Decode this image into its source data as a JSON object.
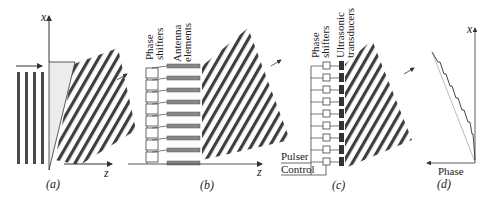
{
  "figure": {
    "colors": {
      "stripe_dark": "#3a3a3a",
      "stripe_light": "#ffffff",
      "prism_fill": "#e9e9e9",
      "line": "#333333",
      "antenna": "#888888",
      "transducer": "#333333"
    },
    "panels": [
      {
        "id": "a",
        "caption": "(a)",
        "axis_x": "x",
        "axis_z": "z",
        "description": "Plane wave passing through a prism, tilted output wavefronts"
      },
      {
        "id": "b",
        "caption": "(b)",
        "label_phase_shifters": "Phase shifters",
        "label_phase_line1": "Phase",
        "label_phase_line2": "shifters",
        "label_elements_line1": "Antenna",
        "label_elements_line2": "elements",
        "axis_z": "z",
        "element_count": 9
      },
      {
        "id": "c",
        "caption": "(c)",
        "label_phase_line1": "Phase",
        "label_phase_line2": "shifters",
        "label_trans_line1": "Ultrasonic",
        "label_trans_line2": "transducers",
        "label_pulser": "Pulser",
        "label_control": "Control",
        "element_count": 9
      },
      {
        "id": "d",
        "caption": "(d)",
        "axis_x": "x",
        "axis_phase": "Phase"
      }
    ]
  }
}
